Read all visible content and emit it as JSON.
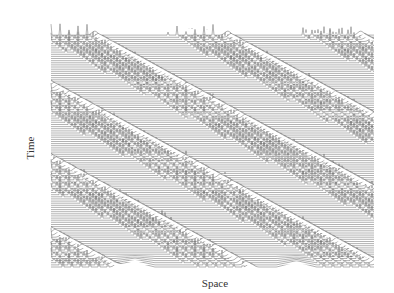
{
  "chart_data": {
    "type": "line",
    "subtype": "waterfall-space-time",
    "title": "",
    "xlabel": "Space",
    "ylabel": "Time",
    "grid": false,
    "legend": null,
    "x_ticks": [],
    "y_ticks": [],
    "n_traces": 110,
    "trace_color": "#555555",
    "sources_x_fraction": [
      0.26,
      0.76
    ],
    "band_slope_px_per_px": -0.55,
    "band_count": 9
  },
  "labels": {
    "xlabel": "Space",
    "ylabel": "Time"
  },
  "layout": {
    "plot_left": 51,
    "plot_right": 374,
    "plot_top": 33,
    "plot_bottom": 267,
    "peak_height": 14
  }
}
